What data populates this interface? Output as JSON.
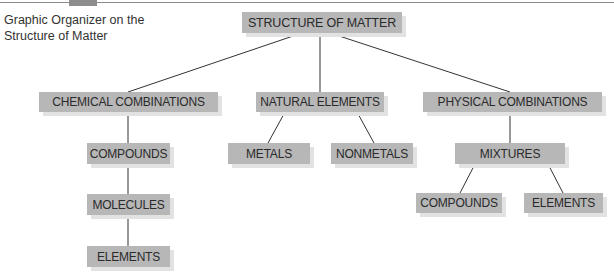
{
  "caption": {
    "line1": "Graphic Organizer on the",
    "line2": "Structure of Matter"
  },
  "colors": {
    "node_fill": "#b7b7b7",
    "node_shadow": "#e2e2e2",
    "edge": "#333333",
    "text": "#2a2a2a"
  },
  "nodes": {
    "root": "STRUCTURE OF MATTER",
    "chemical": "CHEMICAL COMBINATIONS",
    "natural": "NATURAL ELEMENTS",
    "physical": "PHYSICAL COMBINATIONS",
    "chem_compounds": "COMPOUNDS",
    "chem_molecules": "MOLECULES",
    "chem_elements": "ELEMENTS",
    "metals": "METALS",
    "nonmetals": "NONMETALS",
    "mixtures": "MIXTURES",
    "mix_compounds": "COMPOUNDS",
    "mix_elements": "ELEMENTS"
  },
  "edges": [
    [
      "root",
      "chemical"
    ],
    [
      "root",
      "natural"
    ],
    [
      "root",
      "physical"
    ],
    [
      "chemical",
      "chem_compounds"
    ],
    [
      "chem_compounds",
      "chem_molecules"
    ],
    [
      "chem_molecules",
      "chem_elements"
    ],
    [
      "natural",
      "metals"
    ],
    [
      "natural",
      "nonmetals"
    ],
    [
      "physical",
      "mixtures"
    ],
    [
      "mixtures",
      "mix_compounds"
    ],
    [
      "mixtures",
      "mix_elements"
    ]
  ]
}
